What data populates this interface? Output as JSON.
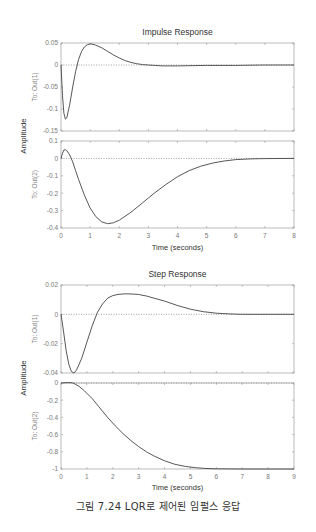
{
  "caption": "그림 7.24  LQR로 제어된 임펄스 응답",
  "chart_data": [
    {
      "type": "line",
      "title": "Impulse Response",
      "xlabel": "Time (seconds)",
      "ylabel": "Amplitude",
      "xlim": [
        0,
        8
      ],
      "xticks": [
        0,
        1,
        2,
        3,
        4,
        5,
        6,
        7,
        8
      ],
      "grid": false,
      "subplots": [
        {
          "ylabel": "To: Out(1)",
          "ylim": [
            -0.15,
            0.05
          ],
          "yticks": [
            0.05,
            0,
            -0.05,
            -0.1,
            -0.15
          ],
          "x": [
            0,
            0.05,
            0.1,
            0.15,
            0.2,
            0.3,
            0.4,
            0.5,
            0.6,
            0.7,
            0.8,
            0.9,
            1.0,
            1.1,
            1.2,
            1.4,
            1.6,
            1.8,
            2.0,
            2.2,
            2.4,
            2.6,
            2.8,
            3.0,
            3.2,
            3.5,
            4,
            5,
            6,
            7,
            8
          ],
          "values": [
            0,
            -0.07,
            -0.11,
            -0.123,
            -0.12,
            -0.09,
            -0.05,
            -0.015,
            0.012,
            0.03,
            0.041,
            0.046,
            0.048,
            0.047,
            0.045,
            0.039,
            0.031,
            0.023,
            0.016,
            0.01,
            0.006,
            0.003,
            0.001,
            0,
            -0.001,
            -0.002,
            -0.002,
            -0.001,
            -0.001,
            0,
            0
          ]
        },
        {
          "ylabel": "To: Out(2)",
          "ylim": [
            -0.4,
            0.1
          ],
          "yticks": [
            0.1,
            0,
            -0.1,
            -0.2,
            -0.3,
            -0.4
          ],
          "x": [
            0,
            0.05,
            0.1,
            0.15,
            0.2,
            0.3,
            0.4,
            0.5,
            0.6,
            0.8,
            1.0,
            1.2,
            1.4,
            1.6,
            1.8,
            2.0,
            2.4,
            2.8,
            3.2,
            3.6,
            4.0,
            4.4,
            4.8,
            5.2,
            5.6,
            6.0,
            6.5,
            7,
            8
          ],
          "values": [
            0,
            0.03,
            0.048,
            0.05,
            0.045,
            0.02,
            -0.02,
            -0.07,
            -0.12,
            -0.21,
            -0.285,
            -0.335,
            -0.365,
            -0.375,
            -0.37,
            -0.355,
            -0.31,
            -0.255,
            -0.2,
            -0.15,
            -0.105,
            -0.07,
            -0.045,
            -0.027,
            -0.015,
            -0.007,
            -0.003,
            -0.001,
            0
          ]
        }
      ]
    },
    {
      "type": "line",
      "title": "Step Response",
      "xlabel": "Time (seconds)",
      "ylabel": "Amplitude",
      "xlim": [
        0,
        9
      ],
      "xticks": [
        0,
        1,
        2,
        3,
        4,
        5,
        6,
        7,
        8,
        9
      ],
      "grid": false,
      "subplots": [
        {
          "ylabel": "To: Out(1)",
          "ylim": [
            -0.04,
            0.02
          ],
          "yticks": [
            0.02,
            0,
            -0.02,
            -0.04
          ],
          "x": [
            0,
            0.1,
            0.2,
            0.3,
            0.4,
            0.5,
            0.6,
            0.8,
            1.0,
            1.2,
            1.4,
            1.6,
            1.8,
            2.0,
            2.2,
            2.5,
            2.8,
            3.0,
            3.3,
            3.6,
            4.0,
            4.5,
            5,
            5.5,
            6,
            6.5,
            7,
            8,
            9
          ],
          "values": [
            0,
            -0.012,
            -0.025,
            -0.034,
            -0.039,
            -0.04,
            -0.038,
            -0.03,
            -0.019,
            -0.008,
            0.001,
            0.007,
            0.011,
            0.0128,
            0.0136,
            0.014,
            0.0138,
            0.0135,
            0.0125,
            0.011,
            0.009,
            0.006,
            0.0035,
            0.0018,
            0.0008,
            0.0003,
            0,
            0,
            0
          ]
        },
        {
          "ylabel": "To: Out(2)",
          "ylim": [
            -1,
            0
          ],
          "yticks": [
            0,
            -0.2,
            -0.4,
            -0.6,
            -0.8,
            -1
          ],
          "x": [
            0,
            0.2,
            0.4,
            0.5,
            0.7,
            0.9,
            1.2,
            1.5,
            1.8,
            2.1,
            2.4,
            2.7,
            3.0,
            3.3,
            3.6,
            4.0,
            4.4,
            4.8,
            5.2,
            5.6,
            6,
            7,
            8,
            9
          ],
          "values": [
            0,
            0.005,
            0.003,
            -0.005,
            -0.04,
            -0.09,
            -0.18,
            -0.29,
            -0.4,
            -0.5,
            -0.59,
            -0.67,
            -0.74,
            -0.8,
            -0.85,
            -0.905,
            -0.945,
            -0.97,
            -0.985,
            -0.994,
            -0.998,
            -1,
            -1,
            -1
          ]
        }
      ]
    }
  ]
}
